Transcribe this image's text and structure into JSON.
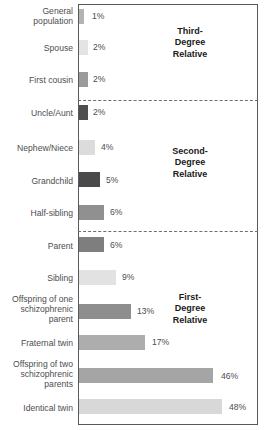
{
  "chart_data": {
    "type": "bar",
    "orientation": "horizontal",
    "title": "",
    "xlabel": "",
    "ylabel": "",
    "xlim": [
      0,
      60
    ],
    "grid": false,
    "legend": null,
    "categories": [
      "General\npopulation",
      "Spouse",
      "First cousin",
      "Uncle/Aunt",
      "Nephew/Niece",
      "Grandchild",
      "Half-sibling",
      "Parent",
      "Sibling",
      "Offspring of one\nschizophrenic\nparent",
      "Fraternal twin",
      "Offspring of two\nschizophrenic\nparents",
      "Identical twin"
    ],
    "values": [
      1,
      2,
      2,
      2,
      4,
      5,
      6,
      6,
      9,
      13,
      17,
      46,
      48
    ],
    "value_labels": [
      "1%",
      "2%",
      "2%",
      "2%",
      "4%",
      "5%",
      "6%",
      "6%",
      "9%",
      "13%",
      "17%",
      "46%",
      "48%"
    ],
    "bar_colors": [
      "#b3b3b3",
      "#e4e4e4",
      "#9a9a9a",
      "#4f4f4f",
      "#dcdcdc",
      "#4a4a4a",
      "#909090",
      "#7e7e7e",
      "#e2e2e2",
      "#8e8e8e",
      "#adadad",
      "#a5a5a5",
      "#d8d8d8"
    ],
    "groups": [
      {
        "name": "third-degree",
        "label": "Third-\nDegree\nRelative",
        "categories": [
          "General population",
          "Spouse",
          "First cousin"
        ]
      },
      {
        "name": "second-degree",
        "label": "Second-\nDegree\nRelative",
        "categories": [
          "Uncle/Aunt",
          "Nephew/Niece",
          "Grandchild",
          "Half-sibling"
        ]
      },
      {
        "name": "first-degree",
        "label": "First-\nDegree\nRelative",
        "categories": [
          "Parent",
          "Sibling",
          "Offspring of one schizophrenic parent",
          "Fraternal twin",
          "Offspring of two schizophrenic parents",
          "Identical twin"
        ]
      }
    ]
  },
  "rows": [
    {
      "label": "General\npopulation",
      "value_label": "1%",
      "label_top": 6,
      "bar_top": 9,
      "bar_width": 5,
      "bar_color": "#b3b3b3",
      "value_left": 92,
      "value_top": 11
    },
    {
      "label": "Spouse",
      "value_label": "2%",
      "label_top": 43,
      "bar_top": 40,
      "bar_width": 9,
      "bar_color": "#e4e4e4",
      "value_left": 93,
      "value_top": 42
    },
    {
      "label": "First cousin",
      "value_label": "2%",
      "label_top": 75,
      "bar_top": 72,
      "bar_width": 9,
      "bar_color": "#9a9a9a",
      "value_left": 93,
      "value_top": 74
    },
    {
      "label": "Uncle/Aunt",
      "value_label": "2%",
      "label_top": 108,
      "bar_top": 105,
      "bar_width": 9,
      "bar_color": "#4f4f4f",
      "value_left": 93,
      "value_top": 107
    },
    {
      "label": "Nephew/Niece",
      "value_label": "4%",
      "label_top": 143,
      "bar_top": 140,
      "bar_width": 16,
      "bar_color": "#dcdcdc",
      "value_left": 101,
      "value_top": 142
    },
    {
      "label": "Grandchild",
      "value_label": "5%",
      "label_top": 176,
      "bar_top": 172,
      "bar_width": 21,
      "bar_color": "#4a4a4a",
      "value_left": 106,
      "value_top": 175
    },
    {
      "label": "Half-sibling",
      "value_label": "6%",
      "label_top": 208,
      "bar_top": 205,
      "bar_width": 25,
      "bar_color": "#909090",
      "value_left": 110,
      "value_top": 207
    },
    {
      "label": "Parent",
      "value_label": "6%",
      "label_top": 241,
      "bar_top": 237,
      "bar_width": 25,
      "bar_color": "#7e7e7e",
      "value_left": 110,
      "value_top": 240
    },
    {
      "label": "Sibling",
      "value_label": "9%",
      "label_top": 273,
      "bar_top": 270,
      "bar_width": 37,
      "bar_color": "#e2e2e2",
      "value_left": 122,
      "value_top": 272
    },
    {
      "label": "Offspring of one\nschizophrenic\nparent",
      "value_label": "13%",
      "label_top": 294,
      "bar_top": 304,
      "bar_width": 52,
      "bar_color": "#8e8e8e",
      "value_left": 137,
      "value_top": 306
    },
    {
      "label": "Fraternal twin",
      "value_label": "17%",
      "label_top": 338,
      "bar_top": 335,
      "bar_width": 66,
      "bar_color": "#adadad",
      "value_left": 152,
      "value_top": 337
    },
    {
      "label": "Offspring of two\nschizophrenic\nparents",
      "value_label": "46%",
      "label_top": 359,
      "bar_top": 368,
      "bar_width": 134,
      "bar_color": "#a5a5a5",
      "value_left": 221,
      "value_top": 371
    },
    {
      "label": "Identical twin",
      "value_label": "48%",
      "label_top": 403,
      "bar_top": 399,
      "bar_width": 143,
      "bar_color": "#d8d8d8",
      "value_left": 229,
      "value_top": 402
    }
  ],
  "dividers": [
    {
      "name": "third-to-second",
      "top": 100
    },
    {
      "name": "second-to-first",
      "top": 231
    }
  ],
  "sections": [
    {
      "name": "third-degree",
      "label": "Third-\nDegree\nRelative",
      "left": 145,
      "top": 26
    },
    {
      "name": "second-degree",
      "label": "Second-\nDegree\nRelative",
      "left": 145,
      "top": 146
    },
    {
      "name": "first-degree",
      "label": "First-\nDegree\nRelative",
      "left": 145,
      "top": 292
    }
  ]
}
